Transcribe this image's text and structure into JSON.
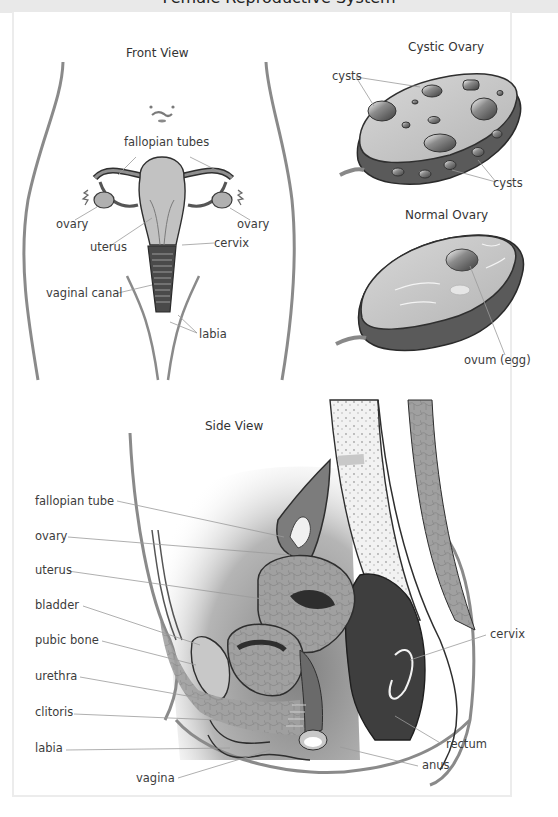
{
  "header": {
    "title_partial": "Female Reproductive System"
  },
  "panels": {
    "front_view": {
      "title": "Front View",
      "labels": {
        "fallopian_tubes": "fallopian tubes",
        "ovary_left": "ovary",
        "ovary_right": "ovary",
        "uterus": "uterus",
        "cervix": "cervix",
        "vaginal_canal": "vaginal canal",
        "labia": "labia"
      }
    },
    "cystic_ovary": {
      "title": "Cystic Ovary",
      "labels": {
        "cysts_top": "cysts",
        "cysts_bottom": "cysts"
      }
    },
    "normal_ovary": {
      "title": "Normal Ovary",
      "labels": {
        "ovum": "ovum (egg)"
      }
    },
    "side_view": {
      "title": "Side View",
      "labels": {
        "fallopian_tube": "fallopian tube",
        "ovary": "ovary",
        "uterus": "uterus",
        "bladder": "bladder",
        "pubic_bone": "pubic bone",
        "urethra": "urethra",
        "clitoris": "clitoris",
        "labia": "labia",
        "vagina": "vagina",
        "cervix": "cervix",
        "rectum": "rectum",
        "anus": "anus"
      }
    }
  },
  "colors": {
    "frame_border": "#ececec",
    "tissue_dark": "#5a5a5a",
    "tissue_mid": "#9a9a9a",
    "tissue_light": "#c8c8c8",
    "outline": "#2e2e2e",
    "leader_line": "#8a8a8a"
  }
}
